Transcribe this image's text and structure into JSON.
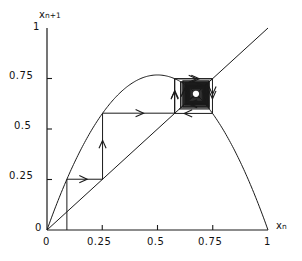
{
  "figure": {
    "background": "#ffffff",
    "ink": "#1a1a1a"
  },
  "axes": {
    "x_label": "x",
    "x_label_sub": "n",
    "y_label": "x",
    "y_label_sub": "n+1",
    "x_ticks": [
      "0",
      "0.25",
      "0.5",
      "0.75",
      "1"
    ],
    "y_ticks": [
      "0",
      "0.25",
      "0.5",
      "0.75",
      "1"
    ],
    "xlim": [
      0,
      1
    ],
    "ylim": [
      0,
      1
    ],
    "origin_px": [
      47,
      230
    ],
    "scale_px": [
      221,
      202
    ]
  },
  "chart_data": {
    "type": "line",
    "title": "",
    "xlabel": "x_n",
    "ylabel": "x_n+1",
    "xlim": [
      0,
      1
    ],
    "ylim": [
      0,
      1
    ],
    "grid": false,
    "legend": "none",
    "series": [
      {
        "name": "logistic map f(x) = r x (1 - x)",
        "kind": "parabola",
        "r": 3.07,
        "peak": [
          0.5,
          0.7675
        ],
        "x": [
          0,
          0.05,
          0.1,
          0.15,
          0.2,
          0.25,
          0.3,
          0.35,
          0.4,
          0.45,
          0.5,
          0.55,
          0.6,
          0.65,
          0.7,
          0.75,
          0.8,
          0.85,
          0.9,
          0.95,
          1
        ],
        "values": [
          0,
          0.1458,
          0.2763,
          0.3914,
          0.4912,
          0.5756,
          0.6447,
          0.6984,
          0.7368,
          0.7598,
          0.7675,
          0.7598,
          0.7368,
          0.6984,
          0.6447,
          0.5756,
          0.4912,
          0.3914,
          0.2763,
          0.1458,
          0
        ]
      },
      {
        "name": "identity line y = x",
        "kind": "line",
        "x": [
          0,
          1
        ],
        "values": [
          0,
          1
        ]
      }
    ],
    "fixed_point": {
      "x": 0.674,
      "y": 0.674,
      "label": ""
    },
    "cobweb": {
      "name": "cobweb iteration trajectory",
      "start_x": 0.09,
      "points": [
        [
          0.09,
          0.0
        ],
        [
          0.09,
          0.2514
        ],
        [
          0.2514,
          0.2514
        ],
        [
          0.2514,
          0.5783
        ],
        [
          0.5783,
          0.5783
        ],
        [
          0.5783,
          0.7487
        ],
        [
          0.7487,
          0.7487
        ],
        [
          0.7487,
          0.5772
        ],
        [
          0.5772,
          0.5772
        ],
        [
          0.5772,
          0.7489
        ],
        [
          0.7489,
          0.7489
        ],
        [
          0.627,
          0.627
        ],
        [
          0.627,
          0.7172
        ],
        [
          0.7172,
          0.7172
        ],
        [
          0.7172,
          0.6227
        ],
        [
          0.6227,
          0.6227
        ],
        [
          0.6227,
          0.7216
        ],
        [
          0.7216,
          0.7216
        ],
        [
          0.7216,
          0.6173
        ],
        [
          0.6173,
          0.6173
        ],
        [
          0.6173,
          0.7263
        ],
        [
          0.7263,
          0.7263
        ],
        [
          0.7263,
          0.6107
        ],
        [
          0.6107,
          0.6107
        ],
        [
          0.6107,
          0.7306
        ],
        [
          0.7306,
          0.7306
        ],
        [
          0.7306,
          0.6043
        ],
        [
          0.6043,
          0.6043
        ],
        [
          0.6043,
          0.734
        ],
        [
          0.734,
          0.734
        ],
        [
          0.734,
          0.599
        ],
        [
          0.599,
          0.599
        ],
        [
          0.674,
          0.674
        ]
      ],
      "arrows": [
        {
          "x": 0.165,
          "y": 0.2514,
          "dir": "right"
        },
        {
          "x": 0.2514,
          "y": 0.425,
          "dir": "up"
        },
        {
          "x": 0.42,
          "y": 0.5783,
          "dir": "right"
        },
        {
          "x": 0.5783,
          "y": 0.672,
          "dir": "up"
        },
        {
          "x": 0.672,
          "y": 0.7487,
          "dir": "right"
        },
        {
          "x": 0.7487,
          "y": 0.668,
          "dir": "down"
        },
        {
          "x": 0.638,
          "y": 0.5772,
          "dir": "left"
        },
        {
          "x": 0.5772,
          "y": 0.668,
          "dir": "up"
        },
        {
          "x": 0.66,
          "y": 0.7489,
          "dir": "right"
        },
        {
          "x": 0.7489,
          "y": 0.69,
          "dir": "down"
        },
        {
          "x": 0.66,
          "y": 0.627,
          "dir": "left"
        },
        {
          "x": 0.627,
          "y": 0.69,
          "dir": "up"
        },
        {
          "x": 0.68,
          "y": 0.7172,
          "dir": "right"
        },
        {
          "x": 0.7172,
          "y": 0.67,
          "dir": "down"
        },
        {
          "x": 0.66,
          "y": 0.6227,
          "dir": "left"
        },
        {
          "x": 0.6227,
          "y": 0.68,
          "dir": "up"
        }
      ]
    }
  }
}
